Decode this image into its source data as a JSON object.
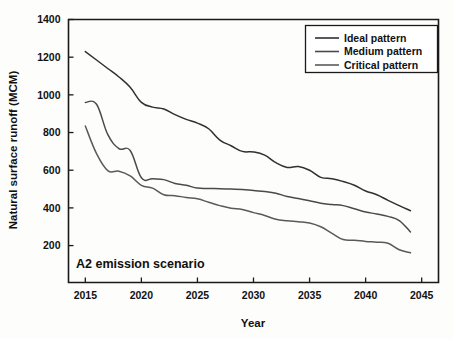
{
  "chart_data": {
    "type": "line",
    "title": "",
    "annotation": "A2 emission scenario",
    "xlabel": "Year",
    "ylabel": "Natural surface runoff (MCM)",
    "xlim": [
      2013.5,
      2046.5
    ],
    "ylim": [
      4,
      1400
    ],
    "xticks": [
      2015,
      2020,
      2025,
      2030,
      2035,
      2040,
      2045
    ],
    "yticks": [
      200,
      400,
      600,
      800,
      1000,
      1200,
      1400
    ],
    "xtick_labels": [
      "2015",
      "2020",
      "2025",
      "2030",
      "2035",
      "2040",
      "2045"
    ],
    "ytick_labels": [
      "200",
      "400",
      "600",
      "800",
      "1000",
      "1200",
      "1400"
    ],
    "grid": false,
    "legend_position": "top-right",
    "x": [
      2015,
      2016,
      2017,
      2018,
      2019,
      2020,
      2021,
      2022,
      2023,
      2024,
      2025,
      2026,
      2027,
      2028,
      2029,
      2030,
      2031,
      2032,
      2033,
      2034,
      2035,
      2036,
      2037,
      2038,
      2039,
      2040,
      2041,
      2042,
      2043,
      2044
    ],
    "series": [
      {
        "name": "Ideal pattern",
        "color": "#303030",
        "values": [
          1230,
          1185,
          1140,
          1095,
          1040,
          960,
          935,
          925,
          895,
          870,
          850,
          820,
          760,
          730,
          700,
          697,
          680,
          640,
          615,
          620,
          600,
          562,
          555,
          540,
          520,
          490,
          470,
          440,
          412,
          385
        ]
      },
      {
        "name": "Medium pattern",
        "color": "#4a4a4a",
        "values": [
          960,
          950,
          790,
          715,
          705,
          560,
          555,
          550,
          530,
          520,
          505,
          503,
          502,
          500,
          498,
          492,
          487,
          478,
          460,
          450,
          438,
          425,
          418,
          412,
          395,
          378,
          368,
          355,
          333,
          272
        ]
      },
      {
        "name": "Critical pattern",
        "color": "#5a5a5a",
        "values": [
          835,
          688,
          598,
          595,
          570,
          520,
          505,
          470,
          465,
          455,
          448,
          430,
          412,
          398,
          392,
          375,
          360,
          340,
          332,
          327,
          320,
          300,
          265,
          232,
          228,
          222,
          218,
          212,
          178,
          162
        ]
      }
    ]
  },
  "legend": {
    "entries": [
      {
        "label": "Ideal pattern"
      },
      {
        "label": "Medium pattern"
      },
      {
        "label": "Critical pattern"
      }
    ]
  }
}
